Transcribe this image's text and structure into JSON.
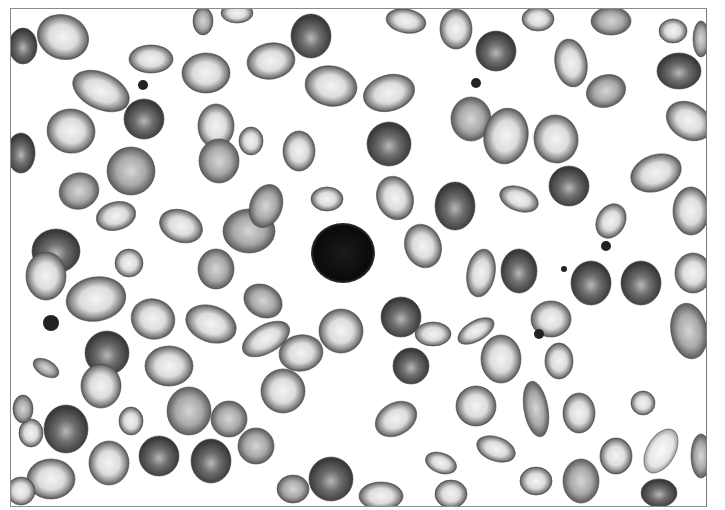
{
  "image": {
    "description": "Grayscale micrograph of a peripheral blood smear showing numerous red blood cells of varying shape (ovalocytes, teardrop cells, target-like cells, spherocytes) with a single dark lymphocyte nucleus in the center and a few small platelet clumps",
    "palette": {
      "background": "#ffffff",
      "cell_rim": "#5a5a5a",
      "cell_center": "#e8e8e8",
      "dense_cell": "#3e3e3e",
      "nucleus": "#111111",
      "frame": "#8a8a8a"
    }
  },
  "cells": [
    {
      "cx": 62,
      "cy": 36,
      "rx": 26,
      "ry": 22,
      "rot": 20,
      "type": "pale"
    },
    {
      "cx": 100,
      "cy": 90,
      "rx": 30,
      "ry": 18,
      "rot": 25,
      "type": "pale"
    },
    {
      "cx": 70,
      "cy": 130,
      "rx": 24,
      "ry": 22,
      "rot": 10,
      "type": "pale"
    },
    {
      "cx": 143,
      "cy": 118,
      "rx": 20,
      "ry": 20,
      "rot": 0,
      "type": "dense"
    },
    {
      "cx": 150,
      "cy": 58,
      "rx": 22,
      "ry": 14,
      "rot": 0,
      "type": "pale"
    },
    {
      "cx": 22,
      "cy": 45,
      "rx": 14,
      "ry": 18,
      "rot": 0,
      "type": "dense"
    },
    {
      "cx": 20,
      "cy": 152,
      "rx": 14,
      "ry": 20,
      "rot": 0,
      "type": "dense"
    },
    {
      "cx": 130,
      "cy": 170,
      "rx": 24,
      "ry": 24,
      "rot": 0,
      "type": "medium"
    },
    {
      "cx": 78,
      "cy": 190,
      "rx": 20,
      "ry": 18,
      "rot": -20,
      "type": "medium"
    },
    {
      "cx": 115,
      "cy": 215,
      "rx": 20,
      "ry": 14,
      "rot": -15,
      "type": "pale"
    },
    {
      "cx": 180,
      "cy": 225,
      "rx": 22,
      "ry": 16,
      "rot": 20,
      "type": "pale"
    },
    {
      "cx": 205,
      "cy": 72,
      "rx": 24,
      "ry": 20,
      "rot": 0,
      "type": "pale"
    },
    {
      "cx": 215,
      "cy": 125,
      "rx": 18,
      "ry": 22,
      "rot": 0,
      "type": "pale"
    },
    {
      "cx": 218,
      "cy": 160,
      "rx": 20,
      "ry": 22,
      "rot": 0,
      "type": "medium"
    },
    {
      "cx": 250,
      "cy": 140,
      "rx": 12,
      "ry": 14,
      "rot": 0,
      "type": "pale"
    },
    {
      "cx": 270,
      "cy": 60,
      "rx": 24,
      "ry": 18,
      "rot": -10,
      "type": "pale"
    },
    {
      "cx": 310,
      "cy": 35,
      "rx": 20,
      "ry": 22,
      "rot": 0,
      "type": "dense"
    },
    {
      "cx": 330,
      "cy": 85,
      "rx": 26,
      "ry": 20,
      "rot": 10,
      "type": "pale"
    },
    {
      "cx": 298,
      "cy": 150,
      "rx": 16,
      "ry": 20,
      "rot": 0,
      "type": "pale"
    },
    {
      "cx": 388,
      "cy": 92,
      "rx": 26,
      "ry": 18,
      "rot": -15,
      "type": "pale"
    },
    {
      "cx": 388,
      "cy": 143,
      "rx": 22,
      "ry": 22,
      "rot": 0,
      "type": "dense"
    },
    {
      "cx": 405,
      "cy": 20,
      "rx": 20,
      "ry": 12,
      "rot": 10,
      "type": "pale"
    },
    {
      "cx": 455,
      "cy": 28,
      "rx": 16,
      "ry": 20,
      "rot": 0,
      "type": "pale"
    },
    {
      "cx": 495,
      "cy": 50,
      "rx": 20,
      "ry": 20,
      "rot": 0,
      "type": "dense"
    },
    {
      "cx": 470,
      "cy": 118,
      "rx": 20,
      "ry": 22,
      "rot": 0,
      "type": "medium"
    },
    {
      "cx": 505,
      "cy": 135,
      "rx": 22,
      "ry": 28,
      "rot": 10,
      "type": "pale"
    },
    {
      "cx": 555,
      "cy": 138,
      "rx": 22,
      "ry": 24,
      "rot": -10,
      "type": "pale"
    },
    {
      "cx": 570,
      "cy": 62,
      "rx": 16,
      "ry": 24,
      "rot": -10,
      "type": "pale"
    },
    {
      "cx": 610,
      "cy": 20,
      "rx": 20,
      "ry": 14,
      "rot": 0,
      "type": "medium"
    },
    {
      "cx": 605,
      "cy": 90,
      "rx": 20,
      "ry": 16,
      "rot": -20,
      "type": "medium"
    },
    {
      "cx": 678,
      "cy": 70,
      "rx": 22,
      "ry": 18,
      "rot": 0,
      "type": "dense"
    },
    {
      "cx": 688,
      "cy": 120,
      "rx": 24,
      "ry": 18,
      "rot": 30,
      "type": "pale"
    },
    {
      "cx": 655,
      "cy": 172,
      "rx": 26,
      "ry": 18,
      "rot": -20,
      "type": "pale"
    },
    {
      "cx": 568,
      "cy": 185,
      "rx": 20,
      "ry": 20,
      "rot": 0,
      "type": "dense"
    },
    {
      "cx": 518,
      "cy": 198,
      "rx": 20,
      "ry": 12,
      "rot": 20,
      "type": "pale"
    },
    {
      "cx": 454,
      "cy": 205,
      "rx": 20,
      "ry": 24,
      "rot": 0,
      "type": "dense"
    },
    {
      "cx": 394,
      "cy": 197,
      "rx": 18,
      "ry": 22,
      "rot": -20,
      "type": "pale"
    },
    {
      "cx": 326,
      "cy": 198,
      "rx": 16,
      "ry": 12,
      "rot": 0,
      "type": "pale"
    },
    {
      "cx": 422,
      "cy": 245,
      "rx": 18,
      "ry": 22,
      "rot": -20,
      "type": "pale"
    },
    {
      "cx": 480,
      "cy": 272,
      "rx": 14,
      "ry": 24,
      "rot": 10,
      "type": "pale"
    },
    {
      "cx": 518,
      "cy": 270,
      "rx": 18,
      "ry": 22,
      "rot": 0,
      "type": "dense"
    },
    {
      "cx": 590,
      "cy": 282,
      "rx": 20,
      "ry": 22,
      "rot": 0,
      "type": "dense"
    },
    {
      "cx": 640,
      "cy": 282,
      "rx": 20,
      "ry": 22,
      "rot": 0,
      "type": "dense"
    },
    {
      "cx": 690,
      "cy": 210,
      "rx": 18,
      "ry": 24,
      "rot": 0,
      "type": "pale"
    },
    {
      "cx": 692,
      "cy": 272,
      "rx": 18,
      "ry": 20,
      "rot": 0,
      "type": "pale"
    },
    {
      "cx": 688,
      "cy": 330,
      "rx": 18,
      "ry": 28,
      "rot": -10,
      "type": "medium"
    },
    {
      "cx": 610,
      "cy": 220,
      "rx": 14,
      "ry": 18,
      "rot": 30,
      "type": "pale"
    },
    {
      "cx": 550,
      "cy": 318,
      "rx": 20,
      "ry": 18,
      "rot": 0,
      "type": "pale"
    },
    {
      "cx": 475,
      "cy": 330,
      "rx": 20,
      "ry": 10,
      "rot": -30,
      "type": "pale"
    },
    {
      "cx": 500,
      "cy": 358,
      "rx": 20,
      "ry": 24,
      "rot": 0,
      "type": "pale"
    },
    {
      "cx": 558,
      "cy": 360,
      "rx": 14,
      "ry": 18,
      "rot": 0,
      "type": "pale"
    },
    {
      "cx": 400,
      "cy": 316,
      "rx": 20,
      "ry": 20,
      "rot": 0,
      "type": "dense"
    },
    {
      "cx": 432,
      "cy": 333,
      "rx": 18,
      "ry": 12,
      "rot": 0,
      "type": "pale"
    },
    {
      "cx": 410,
      "cy": 365,
      "rx": 18,
      "ry": 18,
      "rot": 0,
      "type": "dense"
    },
    {
      "cx": 340,
      "cy": 330,
      "rx": 22,
      "ry": 22,
      "rot": 0,
      "type": "pale"
    },
    {
      "cx": 300,
      "cy": 352,
      "rx": 22,
      "ry": 18,
      "rot": -10,
      "type": "pale"
    },
    {
      "cx": 262,
      "cy": 300,
      "rx": 20,
      "ry": 16,
      "rot": 30,
      "type": "medium"
    },
    {
      "cx": 265,
      "cy": 338,
      "rx": 26,
      "ry": 14,
      "rot": -30,
      "type": "pale"
    },
    {
      "cx": 210,
      "cy": 323,
      "rx": 26,
      "ry": 18,
      "rot": 20,
      "type": "pale"
    },
    {
      "cx": 215,
      "cy": 268,
      "rx": 18,
      "ry": 20,
      "rot": 0,
      "type": "medium"
    },
    {
      "cx": 248,
      "cy": 230,
      "rx": 26,
      "ry": 22,
      "rot": 0,
      "type": "medium"
    },
    {
      "cx": 265,
      "cy": 205,
      "rx": 16,
      "ry": 22,
      "rot": 20,
      "type": "medium"
    },
    {
      "cx": 128,
      "cy": 262,
      "rx": 14,
      "ry": 14,
      "rot": 0,
      "type": "pale"
    },
    {
      "cx": 55,
      "cy": 250,
      "rx": 24,
      "ry": 22,
      "rot": 0,
      "type": "dense"
    },
    {
      "cx": 45,
      "cy": 275,
      "rx": 20,
      "ry": 24,
      "rot": 0,
      "type": "pale"
    },
    {
      "cx": 95,
      "cy": 298,
      "rx": 30,
      "ry": 22,
      "rot": -10,
      "type": "pale"
    },
    {
      "cx": 152,
      "cy": 318,
      "rx": 22,
      "ry": 20,
      "rot": 20,
      "type": "pale"
    },
    {
      "cx": 168,
      "cy": 365,
      "rx": 24,
      "ry": 20,
      "rot": 0,
      "type": "pale"
    },
    {
      "cx": 106,
      "cy": 352,
      "rx": 22,
      "ry": 22,
      "rot": 0,
      "type": "dense"
    },
    {
      "cx": 100,
      "cy": 385,
      "rx": 20,
      "ry": 22,
      "rot": 0,
      "type": "pale"
    },
    {
      "cx": 45,
      "cy": 367,
      "rx": 14,
      "ry": 8,
      "rot": 30,
      "type": "medium"
    },
    {
      "cx": 282,
      "cy": 390,
      "rx": 22,
      "ry": 22,
      "rot": 0,
      "type": "pale"
    },
    {
      "cx": 188,
      "cy": 410,
      "rx": 22,
      "ry": 24,
      "rot": 0,
      "type": "medium"
    },
    {
      "cx": 228,
      "cy": 418,
      "rx": 18,
      "ry": 18,
      "rot": 0,
      "type": "medium"
    },
    {
      "cx": 130,
      "cy": 420,
      "rx": 12,
      "ry": 14,
      "rot": 0,
      "type": "pale"
    },
    {
      "cx": 65,
      "cy": 428,
      "rx": 22,
      "ry": 24,
      "rot": 0,
      "type": "dense"
    },
    {
      "cx": 30,
      "cy": 432,
      "rx": 12,
      "ry": 14,
      "rot": 0,
      "type": "pale"
    },
    {
      "cx": 22,
      "cy": 408,
      "rx": 10,
      "ry": 14,
      "rot": 0,
      "type": "medium"
    },
    {
      "cx": 108,
      "cy": 462,
      "rx": 20,
      "ry": 22,
      "rot": 0,
      "type": "pale"
    },
    {
      "cx": 158,
      "cy": 455,
      "rx": 20,
      "ry": 20,
      "rot": 0,
      "type": "dense"
    },
    {
      "cx": 210,
      "cy": 460,
      "rx": 20,
      "ry": 22,
      "rot": 0,
      "type": "dense"
    },
    {
      "cx": 255,
      "cy": 445,
      "rx": 18,
      "ry": 18,
      "rot": 0,
      "type": "medium"
    },
    {
      "cx": 50,
      "cy": 478,
      "rx": 24,
      "ry": 20,
      "rot": 0,
      "type": "pale"
    },
    {
      "cx": 20,
      "cy": 490,
      "rx": 14,
      "ry": 14,
      "rot": 0,
      "type": "pale"
    },
    {
      "cx": 330,
      "cy": 478,
      "rx": 22,
      "ry": 22,
      "rot": 0,
      "type": "dense"
    },
    {
      "cx": 292,
      "cy": 488,
      "rx": 16,
      "ry": 14,
      "rot": 0,
      "type": "medium"
    },
    {
      "cx": 395,
      "cy": 418,
      "rx": 22,
      "ry": 16,
      "rot": -30,
      "type": "pale"
    },
    {
      "cx": 380,
      "cy": 495,
      "rx": 22,
      "ry": 14,
      "rot": 0,
      "type": "pale"
    },
    {
      "cx": 440,
      "cy": 462,
      "rx": 16,
      "ry": 10,
      "rot": 20,
      "type": "pale"
    },
    {
      "cx": 475,
      "cy": 405,
      "rx": 20,
      "ry": 20,
      "rot": 0,
      "type": "pale"
    },
    {
      "cx": 495,
      "cy": 448,
      "rx": 20,
      "ry": 12,
      "rot": 20,
      "type": "pale"
    },
    {
      "cx": 450,
      "cy": 493,
      "rx": 16,
      "ry": 14,
      "rot": 0,
      "type": "pale"
    },
    {
      "cx": 535,
      "cy": 408,
      "rx": 12,
      "ry": 28,
      "rot": -10,
      "type": "medium"
    },
    {
      "cx": 578,
      "cy": 412,
      "rx": 16,
      "ry": 20,
      "rot": 0,
      "type": "pale"
    },
    {
      "cx": 642,
      "cy": 402,
      "rx": 12,
      "ry": 12,
      "rot": 0,
      "type": "pale"
    },
    {
      "cx": 615,
      "cy": 455,
      "rx": 16,
      "ry": 18,
      "rot": 0,
      "type": "pale"
    },
    {
      "cx": 660,
      "cy": 450,
      "rx": 14,
      "ry": 24,
      "rot": 30,
      "type": "light"
    },
    {
      "cx": 580,
      "cy": 480,
      "rx": 18,
      "ry": 22,
      "rot": 0,
      "type": "medium"
    },
    {
      "cx": 658,
      "cy": 492,
      "rx": 18,
      "ry": 14,
      "rot": 0,
      "type": "dense"
    },
    {
      "cx": 700,
      "cy": 455,
      "rx": 10,
      "ry": 22,
      "rot": 0,
      "type": "medium"
    },
    {
      "cx": 535,
      "cy": 480,
      "rx": 16,
      "ry": 14,
      "rot": 0,
      "type": "pale"
    },
    {
      "cx": 236,
      "cy": 12,
      "rx": 16,
      "ry": 10,
      "rot": 0,
      "type": "pale"
    },
    {
      "cx": 202,
      "cy": 20,
      "rx": 10,
      "ry": 14,
      "rot": 0,
      "type": "medium"
    },
    {
      "cx": 537,
      "cy": 18,
      "rx": 16,
      "ry": 12,
      "rot": 0,
      "type": "pale"
    },
    {
      "cx": 672,
      "cy": 30,
      "rx": 14,
      "ry": 12,
      "rot": 0,
      "type": "pale"
    },
    {
      "cx": 700,
      "cy": 38,
      "rx": 8,
      "ry": 18,
      "rot": 0,
      "type": "medium"
    }
  ],
  "nucleus": {
    "cx": 342,
    "cy": 252,
    "rx": 32,
    "ry": 30
  },
  "platelets": [
    {
      "cx": 142,
      "cy": 84,
      "r": 5
    },
    {
      "cx": 50,
      "cy": 322,
      "r": 8
    },
    {
      "cx": 605,
      "cy": 245,
      "r": 5
    },
    {
      "cx": 538,
      "cy": 333,
      "r": 5
    },
    {
      "cx": 475,
      "cy": 82,
      "r": 5
    },
    {
      "cx": 563,
      "cy": 268,
      "r": 3
    }
  ]
}
